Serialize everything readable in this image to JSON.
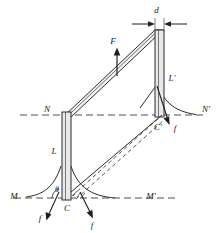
{
  "figure": {
    "type": "engineering-mechanics-diagram",
    "colors": {
      "line": "#2b2b2b",
      "fill_column": "#e8e8e8",
      "fill_beam": "#f2f2f2",
      "dashed": "#555555",
      "background": "#ffffff"
    },
    "labels": {
      "dimension_d": "d",
      "force_F": "F",
      "length_L": "L",
      "point_Lp": "L'",
      "node_N": "N",
      "node_Np": "N'",
      "node_M": "M",
      "node_Mp": "M'",
      "point_C": "C",
      "point_Cp": "C'",
      "angle_theta": "θ",
      "friction_f1": "f",
      "friction_f2": "f",
      "friction_f3": "f"
    },
    "geometry": {
      "ground_line_M_y": 198,
      "ground_line_N_y": 115,
      "left_column_x": 62,
      "right_column_x": 163,
      "column_width_d": 9,
      "beam_top_y": 30
    }
  }
}
